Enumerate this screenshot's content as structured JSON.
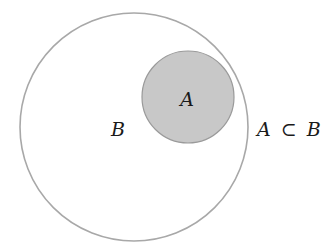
{
  "diagram": {
    "type": "venn",
    "relation": "A ⊂ B",
    "sets": [
      {
        "name": "B",
        "label": "B",
        "cx": 134,
        "cy": 127,
        "r": 114,
        "fill": "#ffffff",
        "stroke": "#a8a8a8"
      },
      {
        "name": "A",
        "label": "A",
        "cx": 188,
        "cy": 97,
        "r": 46,
        "fill": "#c8c8c8",
        "stroke": "#9a9a9a"
      }
    ],
    "labels": {
      "set_a": "A",
      "set_b": "B",
      "relation_left": "A",
      "relation_symbol": "⊂",
      "relation_right": "B"
    }
  }
}
